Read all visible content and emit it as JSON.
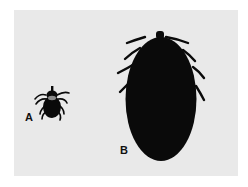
{
  "figure": {
    "labels": {
      "a": "A",
      "b": "B"
    },
    "subjects": [
      {
        "id": "A",
        "description": "unfed tick (small, with legs and scutum visible)"
      },
      {
        "id": "B",
        "description": "engorged tick (large oval dark body)"
      }
    ],
    "colors": {
      "background": "#ffffff",
      "photo_background": "#e9e9e9",
      "tick": "#0a0a0a",
      "scutum_highlight": "#8a8a8a"
    }
  }
}
